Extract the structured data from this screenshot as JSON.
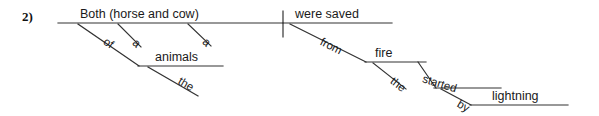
{
  "exercise": {
    "number": "2)"
  },
  "sentence": {
    "text": "Both (horse and cow) of the animals were saved from the fire started by lightning."
  },
  "style": {
    "line_color": "#333333",
    "text_color": "#1a1a1a",
    "background": "#ffffff",
    "line_width": 1
  },
  "diagram": {
    "type": "reed-kellogg-sentence-diagram",
    "baseline": {
      "subject_label": "Both  (horse and cow)",
      "predicate_label": "were saved",
      "divider": "vertical-bar"
    },
    "words": [
      {
        "id": "subject",
        "text": "Both  (horse and cow)",
        "orientation": "horizontal"
      },
      {
        "id": "of",
        "text": "of",
        "orientation": "slanted"
      },
      {
        "id": "a-first",
        "text": "a",
        "orientation": "slanted"
      },
      {
        "id": "a-second",
        "text": "a",
        "orientation": "slanted"
      },
      {
        "id": "animals",
        "text": "animals",
        "orientation": "horizontal"
      },
      {
        "id": "the-animals",
        "text": "the",
        "orientation": "slanted"
      },
      {
        "id": "predicate",
        "text": "were saved",
        "orientation": "horizontal"
      },
      {
        "id": "from",
        "text": "from",
        "orientation": "slanted"
      },
      {
        "id": "fire",
        "text": "fire",
        "orientation": "horizontal"
      },
      {
        "id": "the-fire",
        "text": "the",
        "orientation": "slanted"
      },
      {
        "id": "started",
        "text": "started",
        "orientation": "slanted"
      },
      {
        "id": "by",
        "text": "by",
        "orientation": "slanted"
      },
      {
        "id": "lightning",
        "text": "lightning",
        "orientation": "horizontal"
      }
    ]
  }
}
